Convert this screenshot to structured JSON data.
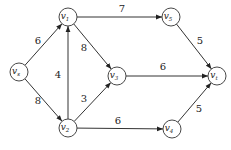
{
  "graph": {
    "title": "",
    "nodes": [
      {
        "id": "vs",
        "base": "v",
        "sub": "s",
        "x": 19,
        "y": 72
      },
      {
        "id": "v1",
        "base": "v",
        "sub": "1",
        "x": 68,
        "y": 17
      },
      {
        "id": "v2",
        "base": "v",
        "sub": "2",
        "x": 68,
        "y": 128
      },
      {
        "id": "v3",
        "base": "v",
        "sub": "3",
        "x": 117,
        "y": 76
      },
      {
        "id": "v4",
        "base": "v",
        "sub": "4",
        "x": 172,
        "y": 129
      },
      {
        "id": "v5",
        "base": "v",
        "sub": "5",
        "x": 171,
        "y": 17
      },
      {
        "id": "vt",
        "base": "v",
        "sub": "t",
        "x": 217,
        "y": 76
      }
    ],
    "edges": [
      {
        "from": "vs",
        "to": "v1",
        "weight": "6",
        "lx": 38,
        "ly": 44
      },
      {
        "from": "vs",
        "to": "v2",
        "weight": "8",
        "lx": 38,
        "ly": 104
      },
      {
        "from": "v2",
        "to": "v1",
        "weight": "4",
        "lx": 58,
        "ly": 78
      },
      {
        "from": "v1",
        "to": "v3",
        "weight": "8",
        "lx": 84,
        "ly": 51
      },
      {
        "from": "v2",
        "to": "v3",
        "weight": "3",
        "lx": 84,
        "ly": 102
      },
      {
        "from": "v1",
        "to": "v5",
        "weight": "7",
        "lx": 122,
        "ly": 12
      },
      {
        "from": "v3",
        "to": "vt",
        "weight": "6",
        "lx": 163,
        "ly": 70
      },
      {
        "from": "v2",
        "to": "v4",
        "weight": "6",
        "lx": 118,
        "ly": 124
      },
      {
        "from": "v5",
        "to": "vt",
        "weight": "5",
        "lx": 200,
        "ly": 44
      },
      {
        "from": "v4",
        "to": "vt",
        "weight": "5",
        "lx": 199,
        "ly": 112
      }
    ]
  }
}
